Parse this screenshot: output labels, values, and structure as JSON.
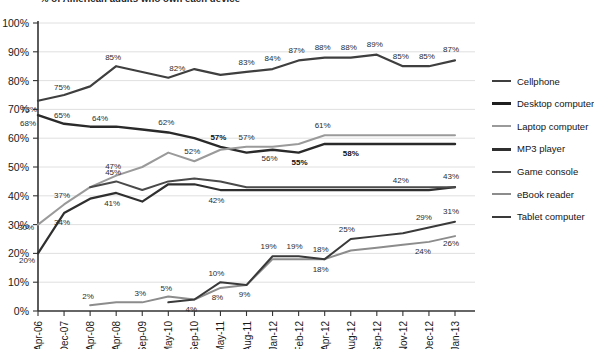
{
  "chart_data": {
    "type": "line",
    "title": "% of American adults who own each device",
    "xlabel": "",
    "ylabel": "",
    "ylim": [
      0,
      100
    ],
    "ytick_labels": [
      "0%",
      "10%",
      "20%",
      "30%",
      "40%",
      "50%",
      "60%",
      "70%",
      "80%",
      "90%",
      "100%"
    ],
    "ytick_values": [
      0,
      10,
      20,
      30,
      40,
      50,
      60,
      70,
      80,
      90,
      100
    ],
    "grid": true,
    "legend_position": "right",
    "categories": [
      "Apr-06",
      "Dec-07",
      "Apr-08",
      "Apr-08",
      "Sep-09",
      "May-10",
      "Sep-10",
      "May-11",
      "Aug-11",
      "Jan-12",
      "Feb-12",
      "Apr-12",
      "Aug-12",
      "Sep-12",
      "Nov-12",
      "Dec-12",
      "Jan-13"
    ],
    "series": [
      {
        "name": "Cellphone",
        "color": "#3f3f3f",
        "width": 2.2,
        "values": [
          73,
          75,
          78,
          85,
          83,
          81,
          84,
          82,
          83,
          84,
          87,
          88,
          88,
          89,
          85,
          85,
          87
        ],
        "labels": [
          {
            "i": 0,
            "text": "73%",
            "dx": -9,
            "dy": 11,
            "bold": false
          },
          {
            "i": 1,
            "text": "75%",
            "dx": -2,
            "dy": -5,
            "bold": false
          },
          {
            "i": 3,
            "text": "85%",
            "dx": -3,
            "dy": -6,
            "bold": false
          },
          {
            "i": 5,
            "text": "82%",
            "dx": 9,
            "dy": -7,
            "bold": false
          },
          {
            "i": 8,
            "text": "83%",
            "dx": 0,
            "dy": -7,
            "bold": false
          },
          {
            "i": 9,
            "text": "84%",
            "dx": 0,
            "dy": -8,
            "bold": false
          },
          {
            "i": 10,
            "text": "87%",
            "dx": -2,
            "dy": -7,
            "bold": false
          },
          {
            "i": 11,
            "text": "88%",
            "dx": -2,
            "dy": -8,
            "bold": false
          },
          {
            "i": 12,
            "text": "88%",
            "dx": -2,
            "dy": -8,
            "bold": false
          },
          {
            "i": 13,
            "text": "89%",
            "dx": -2,
            "dy": -8,
            "bold": false
          },
          {
            "i": 14,
            "text": "85%",
            "dx": -2,
            "dy": -7,
            "bold": false
          },
          {
            "i": 15,
            "text": "85%",
            "dx": -2,
            "dy": -7,
            "bold": false
          },
          {
            "i": 16,
            "text": "87%",
            "dx": -4,
            "dy": -8,
            "bold": false
          }
        ]
      },
      {
        "name": "Desktop computer",
        "color": "#2a2a2a",
        "width": 2.4,
        "values": [
          68,
          65,
          64,
          64,
          63,
          62,
          60,
          57,
          55,
          56,
          55,
          58,
          58,
          58,
          58,
          58,
          58
        ],
        "labels": [
          {
            "i": 0,
            "text": "68%",
            "dx": -10,
            "dy": 11,
            "bold": false
          },
          {
            "i": 1,
            "text": "65%",
            "dx": -2,
            "dy": -6,
            "bold": false
          },
          {
            "i": 2,
            "text": "64%",
            "dx": 10,
            "dy": -6,
            "bold": false
          },
          {
            "i": 5,
            "text": "62%",
            "dx": -2,
            "dy": -7,
            "bold": false
          },
          {
            "i": 7,
            "text": "57%",
            "dx": -2,
            "dy": -7,
            "bold": true
          },
          {
            "i": 9,
            "text": "56%",
            "dx": -3,
            "dy": 11,
            "bold": false
          },
          {
            "i": 10,
            "text": "55%",
            "dx": 1,
            "dy": 12,
            "bold": true
          },
          {
            "i": 12,
            "text": "58%",
            "dx": 0,
            "dy": 12,
            "bold": true
          }
        ]
      },
      {
        "name": "Laptop computer",
        "color": "#9a9a9a",
        "width": 2.0,
        "values": [
          30,
          37,
          43,
          47,
          50,
          55,
          52,
          56,
          57,
          57,
          58,
          61,
          61,
          61,
          61,
          61,
          61
        ],
        "labels": [
          {
            "i": 0,
            "text": "30%",
            "dx": -12,
            "dy": 5,
            "bold": false
          },
          {
            "i": 1,
            "text": "37%",
            "dx": -2,
            "dy": -6,
            "bold": false
          },
          {
            "i": 3,
            "text": "47%",
            "dx": -3,
            "dy": -7,
            "bold": false
          },
          {
            "i": 6,
            "text": "52%",
            "dx": -2,
            "dy": -7,
            "bold": false
          },
          {
            "i": 8,
            "text": "57%",
            "dx": 0,
            "dy": -7,
            "bold": false
          },
          {
            "i": 11,
            "text": "61%",
            "dx": -2,
            "dy": -7,
            "bold": false
          }
        ]
      },
      {
        "name": "MP3 player",
        "color": "#2f2f2f",
        "width": 2.2,
        "values": [
          20,
          34,
          39,
          41,
          38,
          44,
          44,
          42,
          42,
          42,
          42,
          42,
          42,
          42,
          42,
          42,
          43
        ],
        "labels": [
          {
            "i": 0,
            "text": "20%",
            "dx": -11,
            "dy": 10,
            "bold": false
          },
          {
            "i": 1,
            "text": "34%",
            "dx": -2,
            "dy": 12,
            "bold": false
          },
          {
            "i": 3,
            "text": "41%",
            "dx": -4,
            "dy": 13,
            "bold": false
          },
          {
            "i": 7,
            "text": "42%",
            "dx": -4,
            "dy": 13,
            "bold": false
          },
          {
            "i": 14,
            "text": "42%",
            "dx": -2,
            "dy": -7,
            "bold": false
          },
          {
            "i": 16,
            "text": "43%",
            "dx": -4,
            "dy": -8,
            "bold": false
          }
        ]
      },
      {
        "name": "Game console",
        "color": "#4a4a4a",
        "width": 2.0,
        "values": [
          null,
          null,
          43,
          45,
          42,
          45,
          46,
          45,
          43,
          43,
          43,
          43,
          43,
          43,
          43,
          43,
          43
        ],
        "labels": [
          {
            "i": 3,
            "text": "45%",
            "dx": -3,
            "dy": -6,
            "bold": false
          }
        ]
      },
      {
        "name": "eBook reader",
        "color": "#8c8c8c",
        "width": 2.0,
        "values": [
          null,
          null,
          2,
          3,
          3,
          5,
          4,
          8,
          9,
          18,
          18,
          18,
          21,
          22,
          23,
          24,
          26
        ],
        "labels": [
          {
            "i": 2,
            "text": "2%",
            "dx": -2,
            "dy": -6,
            "bold": false
          },
          {
            "i": 4,
            "text": "3%",
            "dx": -2,
            "dy": -6,
            "bold": false
          },
          {
            "i": 5,
            "text": "5%",
            "dx": -2,
            "dy": -6,
            "bold": false
          },
          {
            "i": 7,
            "text": "8%",
            "dx": -3,
            "dy": 12,
            "bold": false
          },
          {
            "i": 8,
            "text": "9%",
            "dx": -2,
            "dy": 12,
            "bold": false
          },
          {
            "i": 11,
            "text": "18%",
            "dx": -4,
            "dy": 13,
            "bold": false
          },
          {
            "i": 15,
            "text": "24%",
            "dx": -6,
            "dy": 12,
            "bold": false
          },
          {
            "i": 16,
            "text": "26%",
            "dx": -4,
            "dy": 10,
            "bold": false
          }
        ]
      },
      {
        "name": "Tablet computer",
        "color": "#3a3a3a",
        "width": 2.0,
        "values": [
          null,
          null,
          null,
          null,
          null,
          3,
          4,
          10,
          9,
          19,
          19,
          18,
          25,
          26,
          27,
          29,
          31
        ],
        "labels": [
          {
            "i": 6,
            "text": "4%",
            "dx": -3,
            "dy": 13,
            "bold": false
          },
          {
            "i": 7,
            "text": "10%",
            "dx": -4,
            "dy": -6,
            "bold": false
          },
          {
            "i": 9,
            "text": "19%",
            "dx": -4,
            "dy": -7,
            "bold": false
          },
          {
            "i": 10,
            "text": "19%",
            "dx": -4,
            "dy": -7,
            "bold": false
          },
          {
            "i": 11,
            "text": "18%",
            "dx": -4,
            "dy": -7,
            "bold": false
          },
          {
            "i": 12,
            "text": "25%",
            "dx": -4,
            "dy": -7,
            "bold": false
          },
          {
            "i": 15,
            "text": "29%",
            "dx": -5,
            "dy": -7,
            "bold": false
          },
          {
            "i": 16,
            "text": "31%",
            "dx": -4,
            "dy": -8,
            "bold": false
          }
        ]
      }
    ]
  },
  "legend": {
    "items": [
      {
        "label": "Cellphone",
        "color": "#3f3f3f",
        "thickness": "2.4px"
      },
      {
        "label": "Desktop computer",
        "color": "#1f1f1f",
        "thickness": "3px"
      },
      {
        "label": "Laptop computer",
        "color": "#9a9a9a",
        "thickness": "2.4px"
      },
      {
        "label": "MP3 player",
        "color": "#2f2f2f",
        "thickness": "3px"
      },
      {
        "label": "Game console",
        "color": "#4a4a4a",
        "thickness": "2.6px"
      },
      {
        "label": "eBook reader",
        "color": "#8c8c8c",
        "thickness": "2.4px"
      },
      {
        "label": "Tablet computer",
        "color": "#3a3a3a",
        "thickness": "2.6px"
      }
    ]
  }
}
